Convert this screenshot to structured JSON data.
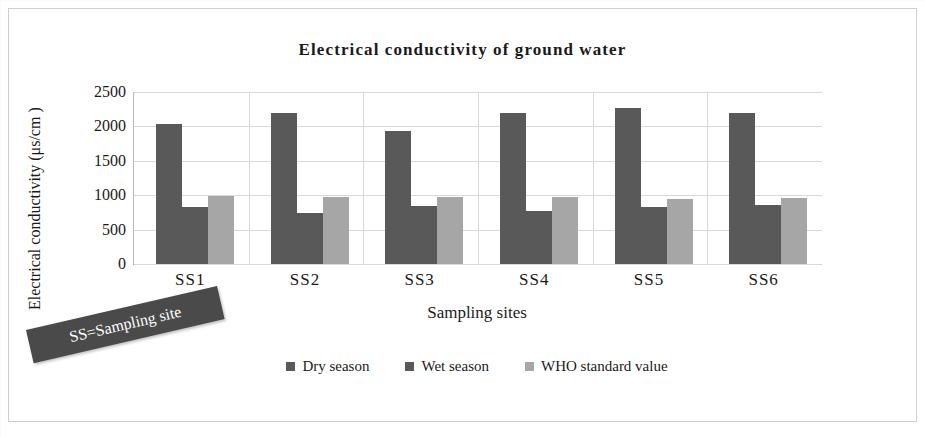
{
  "chart_data": {
    "type": "bar",
    "title": "Electrical conductivity of ground water",
    "xlabel": "Sampling sites",
    "ylabel": "Electrical conductivity (μs/cm )",
    "categories": [
      "SS1",
      "SS2",
      "SS3",
      "SS4",
      "SS5",
      "SS6"
    ],
    "series": [
      {
        "name": "Dry season",
        "color": "#595959",
        "values": [
          2040,
          2190,
          1930,
          2190,
          2270,
          2200
        ]
      },
      {
        "name": "Wet season",
        "color": "#595959",
        "values": [
          830,
          740,
          850,
          770,
          830,
          860
        ]
      },
      {
        "name": "WHO standard value",
        "color": "#a6a6a6",
        "values": [
          990,
          970,
          970,
          970,
          940,
          960
        ]
      }
    ],
    "ylim": [
      0,
      2500
    ],
    "yticks": [
      0,
      500,
      1000,
      1500,
      2000,
      2500
    ],
    "ytick_labels": [
      "0",
      "500",
      "1000",
      "1500",
      "2000",
      "2500"
    ],
    "grid": true,
    "legend_position": "bottom",
    "annotations": [
      {
        "text": "SS=Sampling site",
        "style": "dark-rotated-callout",
        "color": "#4a4a4a",
        "text_color": "#ffffff"
      }
    ]
  },
  "legend": {
    "items": [
      {
        "label": "Dry season",
        "color": "#595959"
      },
      {
        "label": "Wet season",
        "color": "#595959"
      },
      {
        "label": "WHO standard value",
        "color": "#a6a6a6"
      }
    ]
  },
  "annotation": {
    "text": "SS=Sampling site"
  }
}
